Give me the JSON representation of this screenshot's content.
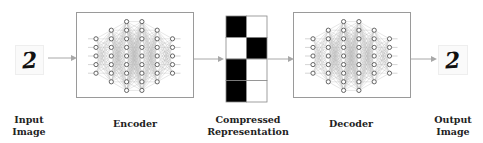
{
  "diagram": {
    "input": {
      "label_line1": "Input",
      "label_line2": "Image",
      "digit": "2"
    },
    "encoder": {
      "label": "Encoder",
      "layers": [
        5,
        7,
        9,
        9,
        7,
        5
      ]
    },
    "latent": {
      "label_line1": "Compressed",
      "label_line2": "Representation",
      "grid": [
        [
          "black",
          "white"
        ],
        [
          "white",
          "black"
        ],
        [
          "black",
          "white"
        ],
        [
          "black",
          "white"
        ]
      ]
    },
    "decoder": {
      "label": "Decoder",
      "layers": [
        5,
        7,
        9,
        9,
        7,
        5
      ]
    },
    "output": {
      "label_line1": "Output",
      "label_line2": "Image",
      "digit": "2"
    },
    "colors": {
      "box_border": "#9a9a9a",
      "arrow": "#a8a8a8",
      "node": "#555555",
      "edge": "#b8b8b8",
      "cell_black": "#000000",
      "cell_white": "#ffffff"
    }
  }
}
